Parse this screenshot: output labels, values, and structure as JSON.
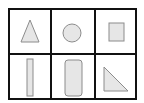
{
  "diagram": {
    "rows": 2,
    "cols": 3,
    "stroke_color": "#111111",
    "shape_fill": "#e6e6e6",
    "shape_stroke": "#8c8c8c",
    "cells": [
      {
        "row": 0,
        "col": 0,
        "shape": "triangle"
      },
      {
        "row": 0,
        "col": 1,
        "shape": "circle"
      },
      {
        "row": 0,
        "col": 2,
        "shape": "square"
      },
      {
        "row": 1,
        "col": 0,
        "shape": "thin-rectangle"
      },
      {
        "row": 1,
        "col": 1,
        "shape": "rounded-rectangle"
      },
      {
        "row": 1,
        "col": 2,
        "shape": "right-triangle"
      }
    ]
  }
}
